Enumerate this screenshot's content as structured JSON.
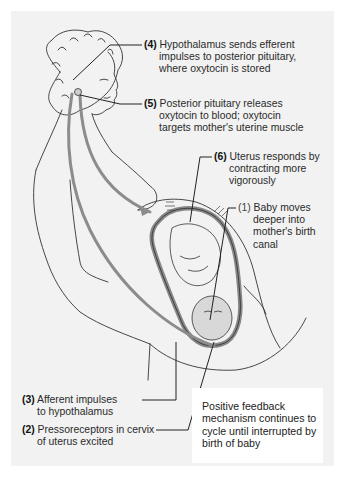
{
  "figure": {
    "background_color": "#f2f2f2",
    "arrow_color": "#8c8c8c",
    "line_color": "#333333"
  },
  "labels": [
    {
      "id": 4,
      "number": "(4)",
      "lines": [
        "Hypothalamus sends efferent",
        "impulses to posterior pituitary,",
        "where oxytocin is stored"
      ]
    },
    {
      "id": 5,
      "number": "(5)",
      "lines": [
        "Posterior pituitary releases",
        "oxytocin to blood; oxytocin",
        "targets mother's uterine muscle"
      ]
    },
    {
      "id": 6,
      "number": "(6)",
      "lines": [
        "Uterus responds by",
        "contracting more",
        "vigorously"
      ]
    },
    {
      "id": 1,
      "number": "(1)",
      "lines": [
        "Baby moves",
        "deeper into",
        "mother's birth",
        "canal"
      ]
    },
    {
      "id": 3,
      "number": "(3)",
      "lines": [
        "Afferent impulses",
        "to hypothalamus"
      ]
    },
    {
      "id": 2,
      "number": "(2)",
      "lines": [
        "Pressoreceptors in cervix",
        "of uterus excited"
      ]
    }
  ],
  "note": {
    "lines": [
      "Positive feedback",
      "mechanism continues to",
      "cycle until interrupted by",
      "birth of baby"
    ]
  }
}
